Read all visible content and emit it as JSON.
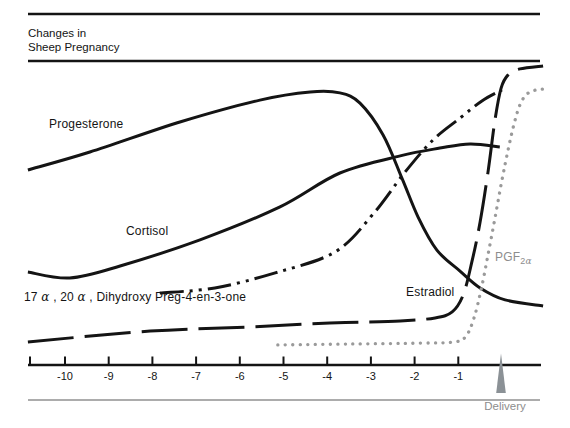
{
  "header": {
    "title_line1": "Changes in",
    "title_line2": "Sheep Pregnancy"
  },
  "colors": {
    "ink": "#141414",
    "gray_series": "#9a9a9a",
    "gray_text": "#8d8d8d",
    "delivery_marker": "#8b9196"
  },
  "labels": {
    "progesterone": "Progesterone",
    "cortisol": "Cortisol",
    "dihydroxy": {
      "p1": "17 ",
      "a1": "α",
      "p2": " , 20 ",
      "a2": "α",
      "p3": " , Dihydroxy Preg-4-en-3-one"
    },
    "estradiol": "Estradiol",
    "pgf": {
      "base": "PGF",
      "sub_num": "2",
      "sub_alpha": "α"
    },
    "delivery": "Delivery"
  },
  "chart_data": {
    "type": "line",
    "title": "Changes in Sheep Pregnancy",
    "xlabel": "",
    "ylabel": "",
    "grid": false,
    "legend": "inline-labels",
    "x_axis": {
      "ticks": [
        -10,
        -9,
        -8,
        -7,
        -6,
        -5,
        -4,
        -3,
        -2,
        -1
      ],
      "tick_labels": [
        "-10",
        "-9",
        "-8",
        "-7",
        "-6",
        "-5",
        "-4",
        "-3",
        "-2",
        "-1"
      ],
      "range": [
        -10.9,
        1.0
      ],
      "delivery_marker_x": 0
    },
    "y_axis": {
      "range": [
        0,
        100
      ],
      "visible": false,
      "units": "relative level (no scale shown)"
    },
    "series": [
      {
        "name": "Progesterone",
        "line_style": "solid",
        "color": "#141414",
        "points": [
          [
            -10.85,
            65
          ],
          [
            -9.43,
            71
          ],
          [
            -7.37,
            81
          ],
          [
            -5.54,
            88.3
          ],
          [
            -4.39,
            91
          ],
          [
            -3.71,
            90.7
          ],
          [
            -3.25,
            87.3
          ],
          [
            -2.72,
            76.7
          ],
          [
            -2.29,
            62.3
          ],
          [
            -1.92,
            49.3
          ],
          [
            -1.49,
            38.3
          ],
          [
            -0.96,
            31.3
          ],
          [
            -0.5,
            25.7
          ],
          [
            0.07,
            21.7
          ],
          [
            0.94,
            19.7
          ]
        ]
      },
      {
        "name": "Cortisol",
        "line_style": "solid",
        "color": "#141414",
        "points": [
          [
            -10.85,
            31
          ],
          [
            -9.89,
            29
          ],
          [
            -8.74,
            33
          ],
          [
            -6.91,
            41.7
          ],
          [
            -5.08,
            52.7
          ],
          [
            -3.71,
            64
          ],
          [
            -2.33,
            69.7
          ],
          [
            -1.42,
            72.3
          ],
          [
            -0.73,
            73.7
          ],
          [
            -0.05,
            72.7
          ]
        ]
      },
      {
        "name": "17α,20α-Dihydroxy Preg-4-en-3-one",
        "line_style": "dash-dot-dot",
        "color": "#141414",
        "points": [
          [
            -7.83,
            24
          ],
          [
            -6.57,
            25.7
          ],
          [
            -5.19,
            30.7
          ],
          [
            -3.82,
            37.7
          ],
          [
            -2.95,
            50.3
          ],
          [
            -2.22,
            64.3
          ],
          [
            -1.58,
            75
          ],
          [
            -0.96,
            82.3
          ],
          [
            -0.46,
            88
          ],
          [
            0,
            91.7
          ]
        ]
      },
      {
        "name": "Estradiol",
        "line_style": "long-dash",
        "color": "#141414",
        "points": [
          [
            -10.85,
            7.7
          ],
          [
            -8.05,
            11.3
          ],
          [
            -5.77,
            12.7
          ],
          [
            -3.94,
            14
          ],
          [
            -2.33,
            14.7
          ],
          [
            -1.53,
            15.7
          ],
          [
            -1.14,
            17.7
          ],
          [
            -0.89,
            23.3
          ],
          [
            -0.69,
            34.3
          ],
          [
            -0.5,
            47.7
          ],
          [
            -0.32,
            64.3
          ],
          [
            -0.16,
            81.7
          ],
          [
            -0.02,
            92.3
          ],
          [
            0.14,
            96.7
          ],
          [
            0.41,
            98.7
          ],
          [
            0.94,
            99.7
          ]
        ]
      },
      {
        "name": "PGF2α",
        "line_style": "dotted",
        "color": "#9a9a9a",
        "points": [
          [
            -5.13,
            6.7
          ],
          [
            -3.48,
            7
          ],
          [
            -1.88,
            7.3
          ],
          [
            -1.08,
            7.7
          ],
          [
            -0.82,
            9.7
          ],
          [
            -0.64,
            15.7
          ],
          [
            -0.48,
            25
          ],
          [
            -0.32,
            36.7
          ],
          [
            -0.16,
            49
          ],
          [
            0,
            61.7
          ],
          [
            0.14,
            71.7
          ],
          [
            0.27,
            80
          ],
          [
            0.41,
            86.7
          ],
          [
            0.57,
            90.3
          ],
          [
            0.78,
            91.7
          ],
          [
            0.98,
            92
          ]
        ]
      }
    ]
  }
}
